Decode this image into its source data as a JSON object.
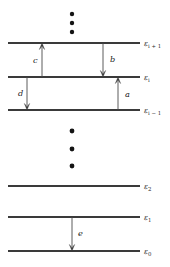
{
  "figure": {
    "background_color": "#ffffff",
    "line_color": "#3a3a3a",
    "arrow_color": "#4a4a4a",
    "dot_color": "#141414",
    "width": 170,
    "height": 267
  },
  "chart_data": {
    "type": "diagram",
    "subtype": "energy-level-diagram",
    "title": "",
    "xlabel": "",
    "ylabel": "",
    "grid": false,
    "legend": null,
    "levels": [
      {
        "id": "e_i_plus_1",
        "label": "ε",
        "sub": "i + 1",
        "y": 43,
        "x_start": 8,
        "x_end": 140,
        "label_x": 144
      },
      {
        "id": "e_i",
        "label": "ε",
        "sub": "i",
        "y": 77,
        "x_start": 8,
        "x_end": 140,
        "label_x": 144
      },
      {
        "id": "e_i_minus_1",
        "label": "ε",
        "sub": "i − 1",
        "y": 110,
        "x_start": 8,
        "x_end": 140,
        "label_x": 144
      },
      {
        "id": "e_2",
        "label": "ε",
        "sub": "2",
        "y": 186,
        "x_start": 8,
        "x_end": 140,
        "label_x": 144
      },
      {
        "id": "e_1",
        "label": "ε",
        "sub": "1",
        "y": 217,
        "x_start": 8,
        "x_end": 140,
        "label_x": 144
      },
      {
        "id": "e_0",
        "label": "ε",
        "sub": "0",
        "y": 251,
        "x_start": 8,
        "x_end": 140,
        "label_x": 144
      }
    ],
    "transitions": [
      {
        "id": "a",
        "label": "a",
        "direction": "up",
        "x": 118,
        "from_level": "e_i_minus_1",
        "to_level": "e_i",
        "y_from": 110,
        "y_to": 77,
        "label_x": 125,
        "label_y": 97
      },
      {
        "id": "b",
        "label": "b",
        "direction": "down",
        "x": 103,
        "from_level": "e_i_plus_1",
        "to_level": "e_i",
        "y_from": 43,
        "y_to": 77,
        "label_x": 110,
        "label_y": 62
      },
      {
        "id": "c",
        "label": "c",
        "direction": "up",
        "x": 42,
        "from_level": "e_i",
        "to_level": "e_i_plus_1",
        "y_from": 77,
        "y_to": 43,
        "label_x": 33,
        "label_y": 63
      },
      {
        "id": "d",
        "label": "d",
        "direction": "down",
        "x": 27,
        "from_level": "e_i",
        "to_level": "e_i_minus_1",
        "y_from": 77,
        "y_to": 110,
        "label_x": 18,
        "label_y": 96
      },
      {
        "id": "e",
        "label": "e",
        "direction": "down",
        "x": 72,
        "from_level": "e_1",
        "to_level": "e_0",
        "y_from": 217,
        "y_to": 251,
        "label_x": 78,
        "label_y": 236
      }
    ],
    "ellipses": [
      {
        "id": "upper-ellipsis",
        "x": 72,
        "dots_y": [
          14,
          23,
          32
        ],
        "radius": 2.2
      },
      {
        "id": "middle-ellipsis",
        "x": 72,
        "dots_y": [
          131,
          149,
          166
        ],
        "radius": 2.4
      }
    ]
  }
}
